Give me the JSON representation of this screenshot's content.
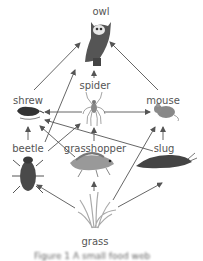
{
  "diagram": {
    "type": "food-web",
    "nodes": [
      {
        "id": "owl",
        "label": "owl",
        "x": 101,
        "y": 12
      },
      {
        "id": "spider",
        "label": "spider",
        "x": 95,
        "y": 82
      },
      {
        "id": "shrew",
        "label": "shrew",
        "x": 28,
        "y": 97
      },
      {
        "id": "mouse",
        "label": "mouse",
        "x": 164,
        "y": 97
      },
      {
        "id": "beetle",
        "label": "beetle",
        "x": 28,
        "y": 145
      },
      {
        "id": "grasshopper",
        "label": "grasshopper",
        "x": 95,
        "y": 145
      },
      {
        "id": "slug",
        "label": "slug",
        "x": 164,
        "y": 145
      },
      {
        "id": "grass",
        "label": "grass",
        "x": 95,
        "y": 241
      }
    ],
    "edges": [
      {
        "from": "shrew",
        "to": "owl"
      },
      {
        "from": "beetle",
        "to": "owl"
      },
      {
        "from": "spider",
        "to": "owl"
      },
      {
        "from": "mouse",
        "to": "owl"
      },
      {
        "from": "spider",
        "to": "shrew"
      },
      {
        "from": "spider",
        "to": "mouse"
      },
      {
        "from": "beetle",
        "to": "shrew"
      },
      {
        "from": "grasshopper",
        "to": "shrew"
      },
      {
        "from": "slug",
        "to": "shrew"
      },
      {
        "from": "beetle",
        "to": "spider"
      },
      {
        "from": "grasshopper",
        "to": "spider"
      },
      {
        "from": "slug",
        "to": "mouse"
      },
      {
        "from": "grass",
        "to": "mouse"
      },
      {
        "from": "grass",
        "to": "beetle"
      },
      {
        "from": "grass",
        "to": "grasshopper"
      },
      {
        "from": "grass",
        "to": "slug"
      }
    ],
    "caption": "Figure 1 A small food web"
  },
  "colors": {
    "arrow": "#555555",
    "label": "#555555",
    "animal_dark": "#4a4a4a",
    "animal_mid": "#7a7a7a",
    "grass": "#a9a9a9"
  }
}
